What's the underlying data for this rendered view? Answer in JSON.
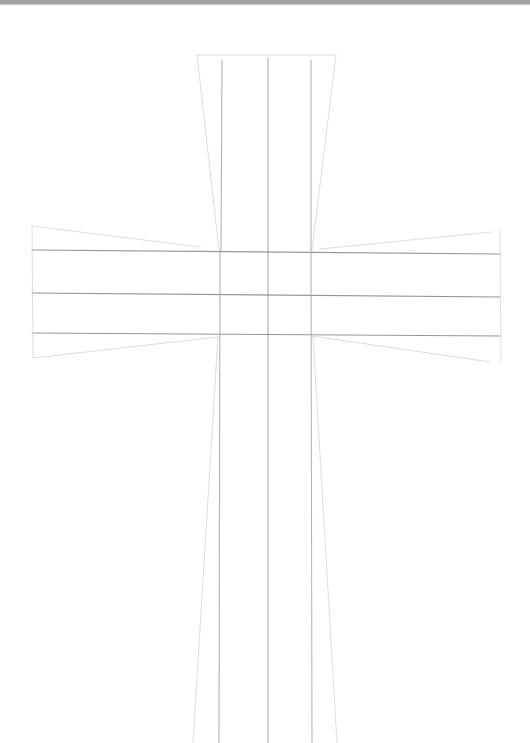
{
  "image": {
    "subject": "pencil sketch of a cross with construction lines",
    "background": "#ffffff",
    "top_border_color": "#a0a0a0"
  },
  "strokes": {
    "dark": "#8a8a8a",
    "medium": "#a9a9a9",
    "light": "#cfcfcf"
  },
  "lines": [
    {
      "name": "top-edge",
      "x1": 197,
      "y1": 55,
      "x2": 336,
      "y2": 55,
      "tone": "light",
      "w": 0.8
    },
    {
      "name": "stem-outline-top-left",
      "x1": 197,
      "y1": 55,
      "x2": 219,
      "y2": 250,
      "tone": "light",
      "w": 0.8
    },
    {
      "name": "stem-outline-top-right",
      "x1": 336,
      "y1": 55,
      "x2": 312,
      "y2": 250,
      "tone": "light",
      "w": 0.8
    },
    {
      "name": "stem-guide-left-upper",
      "x1": 222,
      "y1": 60,
      "x2": 221,
      "y2": 250,
      "tone": "medium",
      "w": 1.1
    },
    {
      "name": "stem-guide-center",
      "x1": 268,
      "y1": 58,
      "x2": 268,
      "y2": 743,
      "tone": "medium",
      "w": 1.2
    },
    {
      "name": "stem-guide-right-upper",
      "x1": 311,
      "y1": 60,
      "x2": 311,
      "y2": 250,
      "tone": "medium",
      "w": 1.1
    },
    {
      "name": "arm-guide-top",
      "x1": 32,
      "y1": 250,
      "x2": 500,
      "y2": 254,
      "tone": "dark",
      "w": 1.1
    },
    {
      "name": "arm-guide-middle",
      "x1": 32,
      "y1": 293,
      "x2": 500,
      "y2": 297,
      "tone": "dark",
      "w": 1.1
    },
    {
      "name": "arm-guide-bottom",
      "x1": 32,
      "y1": 333,
      "x2": 500,
      "y2": 336,
      "tone": "dark",
      "w": 1.0
    },
    {
      "name": "left-arm-end",
      "x1": 32,
      "y1": 226,
      "x2": 33,
      "y2": 358,
      "tone": "light",
      "w": 0.8
    },
    {
      "name": "left-arm-outline-top",
      "x1": 32,
      "y1": 226,
      "x2": 200,
      "y2": 247,
      "tone": "light",
      "w": 0.8
    },
    {
      "name": "left-arm-outline-bottom",
      "x1": 33,
      "y1": 358,
      "x2": 218,
      "y2": 337,
      "tone": "light",
      "w": 0.8
    },
    {
      "name": "right-arm-end",
      "x1": 500,
      "y1": 230,
      "x2": 501,
      "y2": 362,
      "tone": "light",
      "w": 0.8
    },
    {
      "name": "right-arm-outline-top",
      "x1": 492,
      "y1": 232,
      "x2": 320,
      "y2": 249,
      "tone": "light",
      "w": 0.8
    },
    {
      "name": "right-arm-outline-bottom",
      "x1": 312,
      "y1": 336,
      "x2": 490,
      "y2": 362,
      "tone": "light",
      "w": 0.8
    },
    {
      "name": "stem-guide-left-lower",
      "x1": 220,
      "y1": 250,
      "x2": 219,
      "y2": 743,
      "tone": "medium",
      "w": 1.1
    },
    {
      "name": "stem-guide-right-lower",
      "x1": 311,
      "y1": 250,
      "x2": 312,
      "y2": 743,
      "tone": "medium",
      "w": 1.0
    },
    {
      "name": "stem-outline-bottom-left",
      "x1": 218,
      "y1": 336,
      "x2": 193,
      "y2": 743,
      "tone": "light",
      "w": 0.8
    },
    {
      "name": "stem-outline-bottom-right",
      "x1": 313,
      "y1": 336,
      "x2": 337,
      "y2": 743,
      "tone": "light",
      "w": 0.8
    }
  ]
}
